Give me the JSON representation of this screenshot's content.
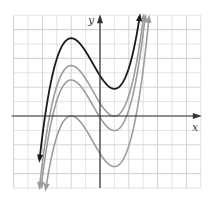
{
  "chart_data": {
    "type": "line",
    "title": "",
    "xlabel": "x",
    "ylabel": "y",
    "xlim": [
      -6,
      7
    ],
    "ylim": [
      -5,
      7
    ],
    "grid": true,
    "grid_step": 1,
    "legend": null,
    "base_function": "y = 0.26x^3 + 0.39x^2 - 1.56x + c",
    "series": [
      {
        "name": "curve-1 (black)",
        "color": "#222222",
        "c": 2.8,
        "local_max": [
          -2,
          5.4
        ],
        "local_min": [
          1,
          1.9
        ],
        "x": [
          -3.5,
          -3,
          -2.5,
          -2,
          -1,
          0,
          1,
          2,
          2.5,
          3
        ],
        "y": [
          -0.71,
          1.37,
          2.48,
          5.4,
          1.89,
          2.8,
          1.89,
          0.72,
          2.8,
          6.05
        ]
      },
      {
        "name": "curve-2 (gray)",
        "color": "#9a9a9a",
        "c": 0.9,
        "local_max": [
          -2,
          3.5
        ],
        "local_min": [
          1,
          0
        ],
        "x": [
          -3.5,
          -3,
          -2.5,
          -2,
          -1,
          0,
          1,
          2,
          2.5,
          3
        ],
        "y": [
          -2.61,
          -0.53,
          0.58,
          3.5,
          2.59,
          0.9,
          0,
          1.42,
          3.5,
          6.75
        ]
      },
      {
        "name": "curve-3 (gray)",
        "color": "#9a9a9a",
        "c": -0.1,
        "local_max": [
          -2,
          2.5
        ],
        "local_min": [
          1,
          -1
        ],
        "x": [
          -3.5,
          -3,
          -2.5,
          -2,
          -1,
          0,
          1,
          2,
          2.5,
          3
        ],
        "y": [
          -3.61,
          -1.53,
          -0.42,
          2.5,
          1.59,
          -0.1,
          -1.01,
          0.42,
          2.5,
          5.75
        ]
      },
      {
        "name": "curve-4 (gray)",
        "color": "#9a9a9a",
        "c": -2.6,
        "local_max": [
          -2,
          0
        ],
        "local_min": [
          1,
          -3.5
        ],
        "x": [
          -3.5,
          -3,
          -2.5,
          -2,
          -1,
          0,
          1,
          2,
          2.5,
          3
        ],
        "y": [
          -3.51,
          -1.43,
          -0.32,
          0,
          -0.91,
          -2.6,
          -3.51,
          -2.08,
          0,
          3.25
        ]
      }
    ]
  },
  "axes": {
    "x_label": "x",
    "y_label": "y"
  },
  "colors": {
    "grid": "#d6d6d6",
    "axis": "#333333",
    "black_curve": "#1a1a1a",
    "gray_curve": "#9c9c9c"
  },
  "layout": {
    "origin_px": [
      100,
      116
    ],
    "unit_px": 14.4
  }
}
